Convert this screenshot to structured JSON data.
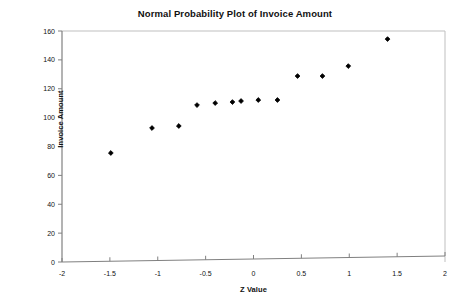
{
  "chart_data": {
    "type": "scatter",
    "title": "Normal Probability Plot of Invoice Amount",
    "xlabel": "Z Value",
    "ylabel": "Invoice Amount",
    "xlim": [
      -2,
      2
    ],
    "ylim": [
      0,
      160
    ],
    "xticks": [
      -2,
      -1.5,
      -1,
      -0.5,
      0,
      0.5,
      1,
      1.5,
      2
    ],
    "xtick_labels": [
      "-2",
      "-1.5",
      "-1",
      "-0.5",
      "0",
      "0.5",
      "1",
      "1.5",
      "2"
    ],
    "yticks": [
      0,
      20,
      40,
      60,
      80,
      100,
      120,
      140,
      160
    ],
    "ytick_labels": [
      "0",
      "20",
      "40",
      "60",
      "80",
      "100",
      "120",
      "140",
      "160"
    ],
    "grid": false,
    "legend": false,
    "marker": "diamond",
    "marker_color": "#000000",
    "series": [
      {
        "name": "Invoice Amount",
        "points": [
          {
            "x": -1.49,
            "y": 75.5
          },
          {
            "x": -1.06,
            "y": 92.8
          },
          {
            "x": -0.78,
            "y": 94.2
          },
          {
            "x": -0.59,
            "y": 108.7
          },
          {
            "x": -0.4,
            "y": 110.1
          },
          {
            "x": -0.22,
            "y": 110.8
          },
          {
            "x": -0.13,
            "y": 111.5
          },
          {
            "x": 0.05,
            "y": 112.2
          },
          {
            "x": 0.25,
            "y": 112.2
          },
          {
            "x": 0.46,
            "y": 128.8
          },
          {
            "x": 0.72,
            "y": 128.8
          },
          {
            "x": 0.99,
            "y": 135.7
          },
          {
            "x": 1.4,
            "y": 154.4
          }
        ]
      }
    ]
  },
  "axes": {
    "plot_border_color": "#999999",
    "axis_color": "#808080",
    "background": "#ffffff"
  }
}
